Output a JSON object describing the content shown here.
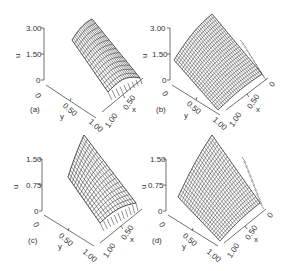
{
  "chart_data": [
    {
      "type": "surface",
      "panel_label": "(a)",
      "zlabel": "u",
      "xlabel": "x",
      "ylabel": "y",
      "z_ticks": [
        "0",
        "1.50",
        "3.00"
      ],
      "y_ticks": [
        "0",
        "0.50",
        "1.00"
      ],
      "x_ticks": [
        "0",
        "0.50",
        "1.00"
      ],
      "zlim": [
        0,
        3.0
      ],
      "xlim": [
        0,
        1.0
      ],
      "ylim": [
        0,
        1.0
      ],
      "description": "Narrow curved band surface; u up to ~3 at one edge, steep drop near x=1 corner"
    },
    {
      "type": "surface",
      "panel_label": "(b)",
      "zlabel": "u",
      "xlabel": "x",
      "ylabel": "y",
      "z_ticks": [
        "0",
        "1.50",
        "3.00"
      ],
      "y_ticks": [
        "0",
        "0.50",
        "1.00"
      ],
      "x_ticks": [
        "0",
        "0.50",
        "1.00"
      ],
      "zlim": [
        0,
        3.0
      ],
      "xlim": [
        0,
        1.0
      ],
      "ylim": [
        0,
        1.0
      ],
      "description": "Full dense mesh surface; u ~3 at far corner descending toward zero near x,y = 1"
    },
    {
      "type": "surface",
      "panel_label": "(c)",
      "zlabel": "u",
      "xlabel": "x",
      "ylabel": "y",
      "z_ticks": [
        "0",
        "0.75",
        "1.50"
      ],
      "y_ticks": [
        "0",
        "0.50",
        "1.00"
      ],
      "x_ticks": [
        "0",
        "0.50",
        "1.00"
      ],
      "zlim": [
        0,
        1.5
      ],
      "xlim": [
        0,
        1.0
      ],
      "ylim": [
        0,
        1.0
      ],
      "description": "Curved band surface; u up to ~1.5"
    },
    {
      "type": "surface",
      "panel_label": "(d)",
      "zlabel": "u",
      "xlabel": "x",
      "ylabel": "y",
      "z_ticks": [
        "0",
        "0.75",
        "1.50"
      ],
      "y_ticks": [
        "0",
        "0.50",
        "1.00"
      ],
      "x_ticks": [
        "0",
        "0.50",
        "1.00"
      ],
      "zlim": [
        0,
        1.5
      ],
      "xlim": [
        0,
        1.0
      ],
      "ylim": [
        0,
        1.0
      ],
      "description": "Full mesh surface; u up to ~1.5 at far corner"
    }
  ],
  "panels": {
    "a": {
      "label": "(a)",
      "z0": "0",
      "z1": "1.50",
      "z2": "3.00",
      "y0": "0",
      "y1": "0.50",
      "y2": "1.00",
      "x0": "0",
      "x1": "0.50",
      "x2": "1.00",
      "u": "u",
      "x": "x",
      "y": "y"
    },
    "b": {
      "label": "(b)",
      "z0": "0",
      "z1": "1.50",
      "z2": "3.00",
      "y0": "0",
      "y1": "0.50",
      "y2": "1.00",
      "x0": "0",
      "x1": "0.50",
      "x2": "1.00",
      "u": "u",
      "x": "x",
      "y": "y"
    },
    "c": {
      "label": "(c)",
      "z0": "0",
      "z1": "0.75",
      "z2": "1.50",
      "y0": "0",
      "y1": "0.50",
      "y2": "1.00",
      "x0": "0",
      "x1": "0.50",
      "x2": "1.00",
      "u": "u",
      "x": "x",
      "y": "y"
    },
    "d": {
      "label": "(d)",
      "z0": "0",
      "z1": "0.75",
      "z2": "1.50",
      "y0": "0",
      "y1": "0.50",
      "y2": "1.00",
      "x0": "0",
      "x1": "0.50",
      "x2": "1.00",
      "u": "u",
      "x": "x",
      "y": "y"
    }
  }
}
